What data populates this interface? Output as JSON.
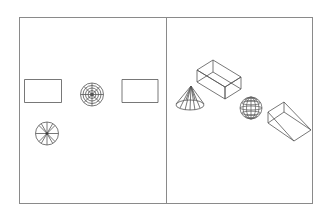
{
  "diagram": {
    "type": "cad-multiview",
    "colors": {
      "line": "#555555",
      "frame": "#8a8a8a",
      "background": "#ffffff"
    },
    "viewports": [
      {
        "name": "top-view",
        "objects": [
          "box-top",
          "sphere-top",
          "wedge-top",
          "cone-top"
        ]
      },
      {
        "name": "isometric-view",
        "objects": [
          "cone-iso",
          "box-iso",
          "sphere-iso",
          "wedge-iso"
        ]
      }
    ]
  }
}
